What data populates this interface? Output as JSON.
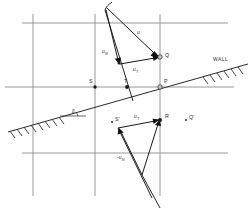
{
  "figure": {
    "background_color": "#fefefe",
    "grid_color": "#8f8f8f",
    "ink_color": "#1a1a1a",
    "width": 252,
    "height": 212
  },
  "labels": {
    "wall": "WALL",
    "angle": "β",
    "point_s": "S",
    "point_t": "T",
    "point_p": "P",
    "point_q": "Q",
    "point_r": "R",
    "point_s_prime": "S'",
    "point_q_prime": "Q'",
    "vec_u": "u",
    "vec_un_sub": "N",
    "vec_ut_sub": "T",
    "vec_un_upper": "u",
    "vec_ut_upper": "u",
    "vec_ut_lower": "u",
    "vec_un_lower": "-u"
  },
  "geometry": {
    "grid": {
      "verticals": [
        33,
        95,
        160
      ],
      "horizontals": [
        23,
        87,
        153
      ]
    },
    "wall": {
      "from": [
        8,
        132
      ],
      "to": [
        248,
        64
      ],
      "hatched": true
    },
    "points": {
      "S": [
        95,
        87
      ],
      "T": [
        127,
        87
      ],
      "P": [
        160,
        87
      ],
      "Q": [
        160,
        57
      ],
      "R": [
        160,
        120
      ],
      "S_prime": [
        112,
        122
      ],
      "Q_prime": [
        190,
        120
      ]
    },
    "vectors_upper": [
      {
        "name": "u",
        "from": [
          107,
          8
        ],
        "to": [
          160,
          57
        ]
      },
      {
        "name": "u_N",
        "from": [
          107,
          8
        ],
        "to": [
          119,
          63
        ]
      },
      {
        "name": "u_T",
        "from": [
          119,
          63
        ],
        "to": [
          160,
          57
        ]
      }
    ],
    "vectors_lower": [
      {
        "name": "-u_N",
        "from": [
          142,
          175
        ],
        "to": [
          118,
          128
        ]
      },
      {
        "name": "u_T",
        "from": [
          118,
          128
        ],
        "to": [
          160,
          120
        ]
      },
      {
        "name": "resultant",
        "from": [
          142,
          175
        ],
        "to": [
          160,
          120
        ]
      }
    ]
  }
}
